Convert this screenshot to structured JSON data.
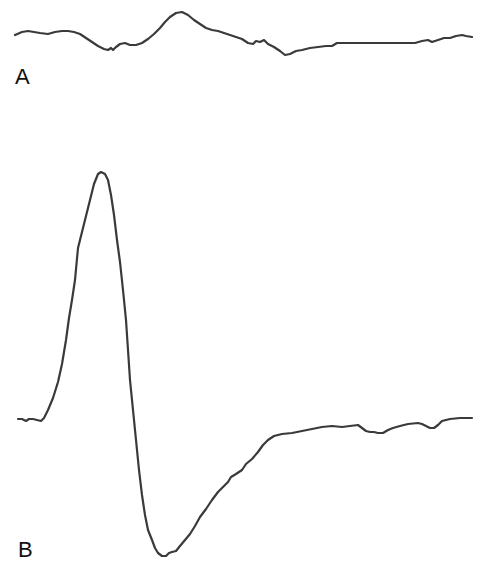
{
  "chart_data": [
    {
      "type": "line",
      "panel": "A",
      "title": "",
      "xlabel": "",
      "ylabel": "",
      "grid": false,
      "legend": null,
      "description": "Low-amplitude waveform trace with small positive deflection followed by small negative trough",
      "points_px": [
        [
          15,
          35
        ],
        [
          22,
          32
        ],
        [
          28,
          31
        ],
        [
          34,
          32
        ],
        [
          40,
          33
        ],
        [
          48,
          34
        ],
        [
          55,
          32
        ],
        [
          62,
          31
        ],
        [
          68,
          31
        ],
        [
          74,
          32
        ],
        [
          80,
          34
        ],
        [
          86,
          38
        ],
        [
          92,
          42
        ],
        [
          98,
          46
        ],
        [
          104,
          49
        ],
        [
          108,
          50
        ],
        [
          111,
          48
        ],
        [
          113,
          50
        ],
        [
          116,
          47
        ],
        [
          120,
          44
        ],
        [
          125,
          43
        ],
        [
          130,
          45
        ],
        [
          136,
          45
        ],
        [
          142,
          43
        ],
        [
          148,
          39
        ],
        [
          154,
          34
        ],
        [
          160,
          28
        ],
        [
          165,
          22
        ],
        [
          170,
          17
        ],
        [
          176,
          13
        ],
        [
          182,
          12
        ],
        [
          188,
          15
        ],
        [
          194,
          20
        ],
        [
          200,
          24
        ],
        [
          206,
          28
        ],
        [
          212,
          30
        ],
        [
          218,
          31
        ],
        [
          224,
          33
        ],
        [
          230,
          35
        ],
        [
          236,
          37
        ],
        [
          242,
          39
        ],
        [
          248,
          43
        ],
        [
          253,
          44
        ],
        [
          256,
          41
        ],
        [
          260,
          42
        ],
        [
          264,
          40
        ],
        [
          268,
          44
        ],
        [
          274,
          47
        ],
        [
          280,
          51
        ],
        [
          285,
          55
        ],
        [
          290,
          54
        ],
        [
          296,
          51
        ],
        [
          302,
          50
        ],
        [
          310,
          48
        ],
        [
          318,
          47
        ],
        [
          326,
          46
        ],
        [
          332,
          46
        ],
        [
          337,
          43
        ],
        [
          345,
          43
        ],
        [
          360,
          43
        ],
        [
          380,
          43
        ],
        [
          400,
          43
        ],
        [
          415,
          43
        ],
        [
          422,
          41
        ],
        [
          428,
          40
        ],
        [
          432,
          42
        ],
        [
          438,
          40
        ],
        [
          444,
          38
        ],
        [
          450,
          38
        ],
        [
          456,
          36
        ],
        [
          462,
          35
        ],
        [
          466,
          36
        ],
        [
          472,
          37
        ]
      ],
      "label_position": {
        "x": 15,
        "y": 68
      }
    },
    {
      "type": "line",
      "panel": "B",
      "title": "",
      "xlabel": "",
      "ylabel": "",
      "grid": false,
      "legend": null,
      "description": "Large biphasic waveform: sharp positive peak followed by deep negative trough and slow return to baseline",
      "points_px": [
        [
          18,
          419
        ],
        [
          22,
          419
        ],
        [
          26,
          421
        ],
        [
          29,
          419
        ],
        [
          33,
          419
        ],
        [
          37,
          420
        ],
        [
          41,
          421
        ],
        [
          44,
          418
        ],
        [
          48,
          410
        ],
        [
          53,
          398
        ],
        [
          58,
          382
        ],
        [
          62,
          364
        ],
        [
          66,
          340
        ],
        [
          69,
          318
        ],
        [
          72,
          300
        ],
        [
          75,
          280
        ],
        [
          78,
          248
        ],
        [
          82,
          232
        ],
        [
          86,
          216
        ],
        [
          90,
          200
        ],
        [
          94,
          184
        ],
        [
          98,
          174
        ],
        [
          101,
          172
        ],
        [
          105,
          174
        ],
        [
          108,
          180
        ],
        [
          111,
          195
        ],
        [
          114,
          215
        ],
        [
          117,
          240
        ],
        [
          120,
          262
        ],
        [
          123,
          290
        ],
        [
          126,
          320
        ],
        [
          128,
          350
        ],
        [
          130,
          380
        ],
        [
          133,
          410
        ],
        [
          136,
          440
        ],
        [
          139,
          470
        ],
        [
          142,
          495
        ],
        [
          145,
          515
        ],
        [
          148,
          530
        ],
        [
          152,
          540
        ],
        [
          155,
          548
        ],
        [
          158,
          553
        ],
        [
          162,
          556
        ],
        [
          166,
          556
        ],
        [
          169,
          553
        ],
        [
          172,
          552
        ],
        [
          176,
          551
        ],
        [
          180,
          546
        ],
        [
          185,
          540
        ],
        [
          190,
          534
        ],
        [
          195,
          526
        ],
        [
          200,
          517
        ],
        [
          206,
          509
        ],
        [
          212,
          500
        ],
        [
          218,
          492
        ],
        [
          223,
          487
        ],
        [
          228,
          482
        ],
        [
          231,
          477
        ],
        [
          236,
          474
        ],
        [
          242,
          470
        ],
        [
          246,
          464
        ],
        [
          252,
          459
        ],
        [
          258,
          452
        ],
        [
          263,
          445
        ],
        [
          268,
          440
        ],
        [
          274,
          436
        ],
        [
          282,
          434
        ],
        [
          292,
          433
        ],
        [
          302,
          431
        ],
        [
          312,
          429
        ],
        [
          322,
          427
        ],
        [
          332,
          426
        ],
        [
          342,
          427
        ],
        [
          350,
          426
        ],
        [
          358,
          425
        ],
        [
          362,
          428
        ],
        [
          366,
          431
        ],
        [
          370,
          432
        ],
        [
          374,
          432
        ],
        [
          378,
          433
        ],
        [
          383,
          433
        ],
        [
          388,
          430
        ],
        [
          393,
          428
        ],
        [
          400,
          426
        ],
        [
          408,
          424
        ],
        [
          418,
          423
        ],
        [
          422,
          424
        ],
        [
          426,
          426
        ],
        [
          430,
          428
        ],
        [
          434,
          428
        ],
        [
          438,
          425
        ],
        [
          442,
          421
        ],
        [
          450,
          419
        ],
        [
          460,
          418
        ],
        [
          472,
          418
        ]
      ],
      "label_position": {
        "x": 18,
        "y": 540
      }
    }
  ],
  "labels": {
    "panel_a": "A",
    "panel_b": "B"
  },
  "colors": {
    "trace": "#3a3a3a",
    "background": "#ffffff",
    "label": "#111111"
  }
}
